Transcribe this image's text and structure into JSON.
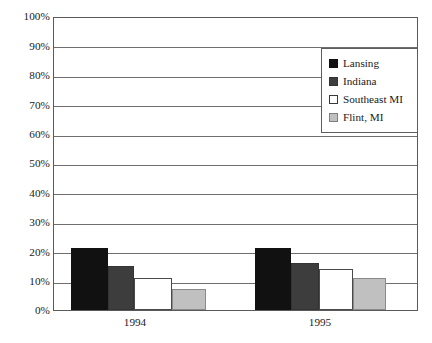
{
  "chart_data": {
    "type": "bar",
    "title": "",
    "xlabel": "",
    "ylabel": "",
    "categories": [
      "1994",
      "1995"
    ],
    "ylim": [
      0,
      100
    ],
    "ytick_labels": [
      "0%",
      "10%",
      "20%",
      "30%",
      "40%",
      "50%",
      "60%",
      "70%",
      "80%",
      "90%",
      "100%"
    ],
    "ytick_values": [
      0,
      10,
      20,
      30,
      40,
      50,
      60,
      70,
      80,
      90,
      100
    ],
    "grid": true,
    "legend_position": "top-right",
    "series": [
      {
        "name": "Lansing",
        "color": "#111111",
        "values": [
          21,
          21
        ]
      },
      {
        "name": "Indiana",
        "color": "#3d3d3d",
        "values": [
          15,
          16
        ]
      },
      {
        "name": "Southeast MI",
        "color": "#ffffff",
        "values": [
          11,
          14
        ]
      },
      {
        "name": "Flint, MI",
        "color": "#c0c0c0",
        "values": [
          7,
          11
        ]
      }
    ]
  },
  "legend": {
    "items": [
      {
        "label": "Lansing",
        "swatch": "legend-swatch-lansing"
      },
      {
        "label": "Indiana",
        "swatch": "legend-swatch-indiana"
      },
      {
        "label": "Southeast MI",
        "swatch": "legend-swatch-southeast-mi"
      },
      {
        "label": "Flint, MI",
        "swatch": "legend-swatch-flint-mi"
      }
    ]
  },
  "axes": {
    "y_labels": [
      "100%",
      "90%",
      "80%",
      "70%",
      "60%",
      "50%",
      "40%",
      "30%",
      "20%",
      "10%",
      "0%"
    ],
    "x_labels": [
      "1994",
      "1995"
    ]
  }
}
